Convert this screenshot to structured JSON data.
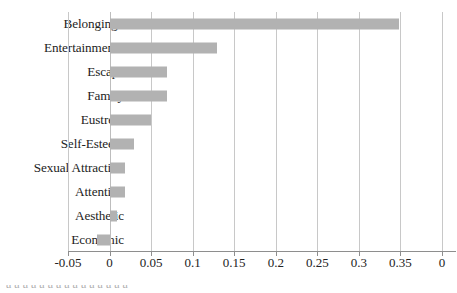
{
  "chart_data": {
    "type": "bar",
    "orientation": "horizontal",
    "title": "",
    "xlabel": "",
    "ylabel": "",
    "categories": [
      "Belonging*",
      "Entertainment*",
      "Escape",
      "Family",
      "Eustress",
      "Self-Esteem",
      "Sexual Attraction",
      "Attention",
      "Aesthetic",
      "Economic"
    ],
    "values": [
      0.348,
      0.129,
      0.069,
      0.069,
      0.05,
      0.029,
      0.019,
      0.019,
      0.009,
      -0.015
    ],
    "xlim": [
      -0.05,
      0.4
    ],
    "xticks": [
      -0.05,
      0,
      0.05,
      0.1,
      0.15,
      0.2,
      0.25,
      0.3,
      0.35,
      0.4
    ],
    "xticklabels": [
      "-0.05",
      "0",
      "0.05",
      "0.1",
      "0.15",
      "0.2",
      "0.25",
      "0.3",
      "0.35",
      "0"
    ],
    "grid": true,
    "legend": false,
    "bar_color": "#b2b2b2",
    "gridline_color": "#c8c8c8",
    "axis_color": "#8e8e8e"
  },
  "footer": {
    "clipped_caption": "a  a     a    a a        a a          a        a  a   a   a  a   a        a"
  }
}
